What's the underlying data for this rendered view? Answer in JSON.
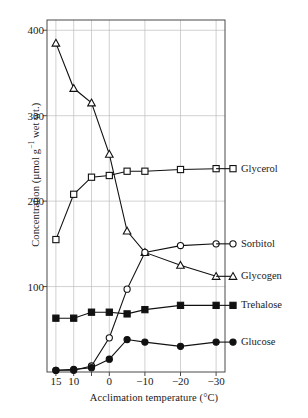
{
  "chart_data": {
    "type": "line",
    "title": "",
    "xlabel": "Acclimation temperature (°C)",
    "ylabel": "Concentration (µmol g⁻¹ wet wt.)",
    "ylabel_parts": {
      "pre": "Concentration (µmol g",
      "sup": "−1",
      "post": " wet wt.)"
    },
    "x": [
      15,
      10,
      5,
      0,
      -5,
      -10,
      -20,
      -30
    ],
    "xtick_labels": [
      "15",
      "10",
      "",
      "0",
      "−10",
      "−20",
      "−30"
    ],
    "xticks": [
      15,
      10,
      5,
      0,
      -10,
      -20,
      -30
    ],
    "xlim": [
      17.5,
      -32.5
    ],
    "ylim": [
      0,
      412
    ],
    "yticks": [
      100,
      200,
      300,
      400
    ],
    "ytick_labels": [
      "100",
      "200",
      "300",
      "400"
    ],
    "grid": "both",
    "legend_position": "right-of-line-ends",
    "series": [
      {
        "name": "Glycogen",
        "marker": "open-triangle",
        "values": [
          385,
          332,
          315,
          255,
          165,
          140,
          125,
          112
        ]
      },
      {
        "name": "Glycerol",
        "marker": "open-square",
        "values": [
          155,
          208,
          228,
          230,
          235,
          235,
          237,
          238
        ]
      },
      {
        "name": "Sorbitol",
        "marker": "open-circle",
        "values": [
          2,
          2,
          7,
          40,
          97,
          140,
          148,
          150
        ]
      },
      {
        "name": "Trehalose",
        "marker": "filled-square",
        "values": [
          63,
          63,
          70,
          70,
          68,
          73,
          78,
          78
        ]
      },
      {
        "name": "Glucose",
        "marker": "filled-circle",
        "values": [
          2,
          3,
          5,
          15,
          38,
          35,
          30,
          35
        ]
      }
    ],
    "legend_labels": {
      "glycerol": "Glycerol",
      "sorbitol": "Sorbitol",
      "glycogen": "Glycogen",
      "trehalose": "Trehalose",
      "glucose": "Glucose"
    },
    "colors": {
      "line": "#111111",
      "grid": "#bdbdbd",
      "frame": "#4a4a4a",
      "background": "#ffffff"
    }
  }
}
